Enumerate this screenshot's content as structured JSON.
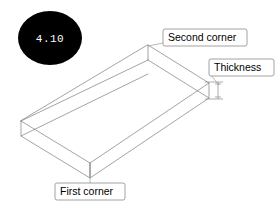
{
  "figure": {
    "badge_label": "4.10",
    "background_color": "#ffffff",
    "line_color": "#7d7d7d",
    "badge_color": "#000000",
    "badge_text_color": "#ffffff",
    "callout_border_color": "#8a8a8a"
  },
  "callouts": [
    {
      "id": "second-corner",
      "label": "Second corner",
      "box": {
        "x": 163,
        "y": 29,
        "width": 84,
        "height": 17
      },
      "text": {
        "x": 168,
        "y": 41
      },
      "leader": "M163,43 L148,46"
    },
    {
      "id": "thickness",
      "label": "Thickness",
      "box": {
        "x": 209,
        "y": 59,
        "width": 65,
        "height": 17
      },
      "text": {
        "x": 214,
        "y": 71
      },
      "leader": "M209,73 L216,86"
    },
    {
      "id": "first-corner",
      "label": "First corner",
      "box": {
        "x": 55,
        "y": 183,
        "width": 70,
        "height": 17
      },
      "text": {
        "x": 60,
        "y": 195
      },
      "leader": "M90,183 L90,163"
    }
  ],
  "shape": {
    "type": "isometric-slab",
    "description": "Rectangular plate drawn in isometric projection with visible top face, two side faces and hidden rear edges.",
    "vertices": {
      "top_apex": [
        148,
        45
      ],
      "right_corner_top": [
        209,
        83
      ],
      "bottom_apex": [
        90,
        163
      ],
      "left_corner_top": [
        21,
        121
      ],
      "left_corner_bottom": [
        21,
        136
      ],
      "right_corner_bottom": [
        209,
        98
      ],
      "bottom_apex_lower": [
        90,
        178
      ],
      "inner_top_apex": [
        148,
        60
      ],
      "inner_left": [
        33,
        124
      ],
      "inner_right": [
        198,
        86
      ]
    },
    "thickness_dimension": {
      "top_y": 83,
      "bottom_y": 99,
      "x": 215
    }
  }
}
